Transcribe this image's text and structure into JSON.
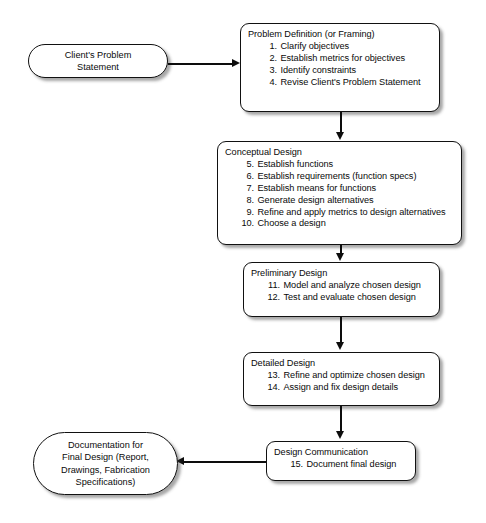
{
  "diagram": {
    "background_color": "#ffffff",
    "line_color": "#0d0d0d",
    "node_fill": "#ffffff"
  },
  "nodes": {
    "client_problem": {
      "shape": "pill",
      "lines": [
        "Client's Problem",
        "Statement"
      ]
    },
    "problem_definition": {
      "shape": "rounded-rect",
      "heading": "Problem Definition (or Framing)",
      "steps": [
        {
          "num": "1.",
          "text": "Clarify objectives"
        },
        {
          "num": "2.",
          "text": "Establish metrics for objectives"
        },
        {
          "num": "3.",
          "text": "Identify constraints"
        },
        {
          "num": "4.",
          "text": "Revise Client's Problem Statement"
        }
      ]
    },
    "conceptual_design": {
      "shape": "rounded-rect",
      "heading": "Conceptual Design",
      "steps": [
        {
          "num": "5.",
          "text": "Establish functions"
        },
        {
          "num": "6.",
          "text": "Establish requirements (function specs)"
        },
        {
          "num": "7.",
          "text": "Establish means for functions"
        },
        {
          "num": "8.",
          "text": "Generate design alternatives"
        },
        {
          "num": "9.",
          "text": "Refine and apply metrics to design alternatives"
        },
        {
          "num": "10.",
          "text": "Choose a design"
        }
      ]
    },
    "preliminary_design": {
      "shape": "rounded-rect",
      "heading": "Preliminary Design",
      "steps": [
        {
          "num": "11.",
          "text": "Model and analyze chosen design"
        },
        {
          "num": "12.",
          "text": "Test and evaluate chosen design"
        }
      ]
    },
    "detailed_design": {
      "shape": "rounded-rect",
      "heading": "Detailed Design",
      "steps": [
        {
          "num": "13.",
          "text": "Refine and optimize chosen design"
        },
        {
          "num": "14.",
          "text": "Assign and fix design details"
        }
      ]
    },
    "design_communication": {
      "shape": "rounded-rect",
      "heading": "Design Communication",
      "steps": [
        {
          "num": "15.",
          "text": "Document final design"
        }
      ]
    },
    "documentation": {
      "shape": "pill",
      "lines": [
        "Documentation for",
        "Final Design (Report,",
        "Drawings, Fabrication",
        "Specifications)"
      ]
    }
  },
  "connectors": [
    {
      "name": "client-to-problem-definition",
      "direction": "right"
    },
    {
      "name": "problem-definition-to-conceptual",
      "direction": "down"
    },
    {
      "name": "conceptual-to-preliminary",
      "direction": "down"
    },
    {
      "name": "preliminary-to-detailed",
      "direction": "down"
    },
    {
      "name": "detailed-to-communication",
      "direction": "down"
    },
    {
      "name": "communication-to-documentation",
      "direction": "left"
    }
  ]
}
